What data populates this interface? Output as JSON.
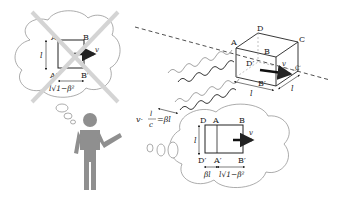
{
  "diagram": {
    "colors": {
      "figure": "#8f8f8f",
      "cross": "#d4d4d4",
      "line": "#222222",
      "wave_dark": "#222222",
      "wave_light": "#9a9a9a"
    },
    "naive_bubble": {
      "status": "crossed-out",
      "labels": {
        "A": "A",
        "B": "B",
        "A_prime": "A′",
        "B_prime": "B′"
      },
      "height_label": "l",
      "width_label": "l√1−β²",
      "velocity_label": "v"
    },
    "cube": {
      "labels": {
        "A": "A",
        "B": "B",
        "C": "C",
        "D": "D",
        "D_prime": "D′",
        "B_prime": "B′",
        "C_prime": "C′"
      },
      "edge_labels": [
        "l",
        "l"
      ],
      "velocity_label": "v"
    },
    "formula": {
      "lhs": "v·",
      "numerator": "l",
      "denominator": "c",
      "rhs": "=βl"
    },
    "observed_bubble": {
      "labels": {
        "D": "D",
        "A": "A",
        "B": "B",
        "D_prime": "D′",
        "A_prime": "A′",
        "B_prime": "B′"
      },
      "height_label": "l",
      "segment_labels": [
        "βl",
        "l√1−β²"
      ],
      "velocity_label": "v"
    },
    "observer": "person-icon"
  }
}
